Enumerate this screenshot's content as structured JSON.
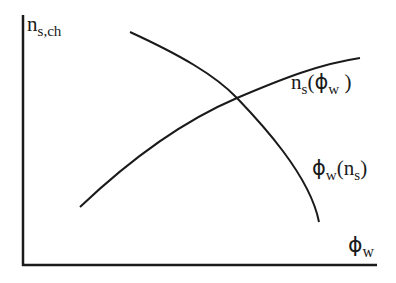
{
  "diagram": {
    "title": "",
    "axes": {
      "y_label_main": "n",
      "y_label_sub": "s,ch",
      "x_label_main": "ϕ",
      "x_label_sub": "w",
      "color": "#1a1a1a"
    },
    "curves": [
      {
        "id": "ns_of_phiw",
        "label_main": "n",
        "label_sub": "s",
        "label_open": "(",
        "label_arg_main": "ϕ",
        "label_arg_sub": "w",
        "label_close": " )",
        "shape": "increasing, concave",
        "path": "M 80 207 C 140 150, 190 118, 237 98 S 320 64, 360 58"
      },
      {
        "id": "phiw_of_ns",
        "label_main": "ϕ",
        "label_sub": "w",
        "label_open": "(",
        "label_arg_main": "n",
        "label_arg_sub": "s",
        "label_close": ")",
        "shape": "decreasing, concave",
        "path": "M 130 32 C 180 55, 215 75, 237 98 S 310 175, 319 222"
      }
    ],
    "intersection": {
      "x": 237,
      "y": 98
    }
  }
}
